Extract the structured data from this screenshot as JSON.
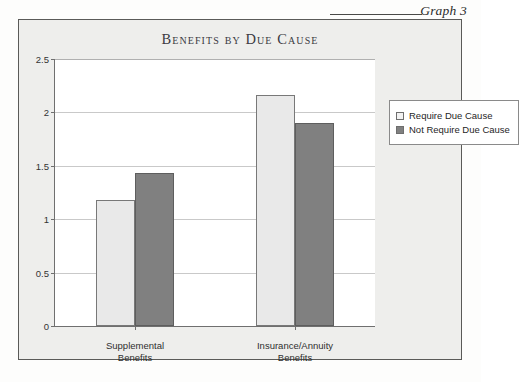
{
  "caption": {
    "label": "Graph 3"
  },
  "chart_data": {
    "type": "bar",
    "title": "Benefits by Due Cause",
    "xlabel": "",
    "ylabel": "",
    "categories": [
      "Supplemental\nBenefits",
      "Insurance/Annuity\nBenefits"
    ],
    "category_lines": [
      [
        "Supplemental",
        "Benefits"
      ],
      [
        "Insurance/Annuity",
        "Benefits"
      ]
    ],
    "series": [
      {
        "name": "Require Due Cause",
        "color": "#e9e9e9",
        "values": [
          1.18,
          2.16
        ]
      },
      {
        "name": "Not Require Due Cause",
        "color": "#808080",
        "values": [
          1.43,
          1.9
        ]
      }
    ],
    "ylim": [
      0,
      2.5
    ],
    "yticks": [
      0,
      0.5,
      1,
      1.5,
      2,
      2.5
    ],
    "ytick_labels": [
      "0",
      "0.5",
      "1",
      "1.5",
      "2",
      "2.5"
    ],
    "grid": true,
    "legend_position": "right"
  }
}
